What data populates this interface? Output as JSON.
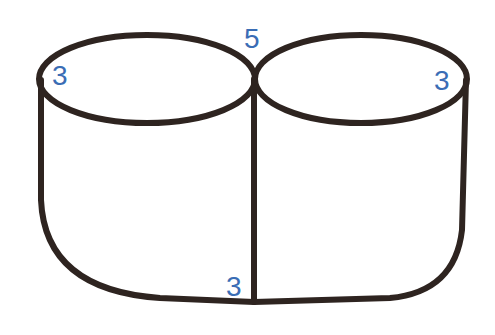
{
  "diagram": {
    "stroke_color": "#2e2420",
    "label_color": "#3a6db5",
    "labels": {
      "left_top": "3",
      "middle_top": "5",
      "right_top": "3",
      "bottom_middle": "3"
    }
  }
}
